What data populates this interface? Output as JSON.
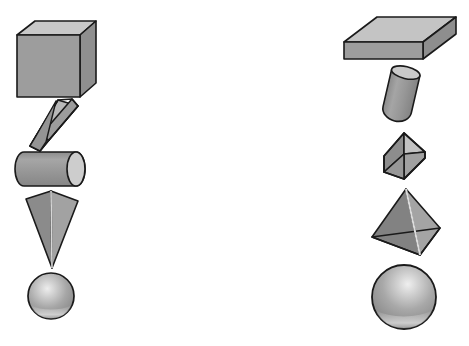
{
  "canvas": {
    "width": 469,
    "height": 346,
    "background_color": "#ffffff",
    "title": "Two columns of shaded 3D geometric solids"
  },
  "palette": {
    "outline": "#1a1a1a",
    "face_front": "#999999",
    "face_top_light": "#c6c6c6",
    "face_side_dark": "#7d7d7d",
    "face_mid": "#8e8e8e",
    "highlight": "#e6e6e6",
    "sphere_base": "#9a9a9a",
    "sphere_highlight": "#e8e8e8",
    "sphere_rim_light": "#d8d8d8"
  },
  "columns": [
    {
      "name": "left-column",
      "label": "Left column of solids",
      "items": [
        {
          "id": "cube",
          "label": "Cube",
          "shape_kind": "cube",
          "center": {
            "x": 56,
            "y": 59
          },
          "bbox": {
            "x": 17,
            "y": 20,
            "w": 80,
            "h": 78
          }
        },
        {
          "id": "tilted-bar",
          "label": "Tilted rectangular prism",
          "shape_kind": "rectangular-prism",
          "center": {
            "x": 56,
            "y": 120
          },
          "bbox": {
            "x": 32,
            "y": 99,
            "w": 48,
            "h": 42
          },
          "rotation_deg": -42
        },
        {
          "id": "horizontal-cylinder",
          "label": "Horizontal cylinder",
          "shape_kind": "cylinder",
          "center": {
            "x": 50,
            "y": 169
          },
          "bbox": {
            "x": 16,
            "y": 152,
            "w": 70,
            "h": 34
          }
        },
        {
          "id": "inverted-cone",
          "label": "Inverted narrow pyramid",
          "shape_kind": "pyramid-inverted",
          "center": {
            "x": 51,
            "y": 230
          },
          "bbox": {
            "x": 26,
            "y": 191,
            "w": 52,
            "h": 78
          }
        },
        {
          "id": "small-sphere",
          "label": "Small sphere",
          "shape_kind": "sphere",
          "center": {
            "x": 51,
            "y": 296
          },
          "radius": 23
        }
      ]
    },
    {
      "name": "right-column",
      "label": "Right column of solids",
      "items": [
        {
          "id": "flat-slab",
          "label": "Flat rectangular slab",
          "shape_kind": "box-slab",
          "center": {
            "x": 399,
            "y": 37
          },
          "bbox": {
            "x": 344,
            "y": 16,
            "w": 112,
            "h": 44
          }
        },
        {
          "id": "small-cylinder",
          "label": "Small tilted cylinder",
          "shape_kind": "cylinder-small",
          "center": {
            "x": 401,
            "y": 91
          },
          "bbox": {
            "x": 385,
            "y": 66,
            "w": 33,
            "h": 50
          },
          "rotation_deg": 12
        },
        {
          "id": "diamond",
          "label": "Diamond (tilted cube)",
          "shape_kind": "rhombohedron",
          "center": {
            "x": 404,
            "y": 156
          },
          "bbox": {
            "x": 384,
            "y": 132,
            "w": 41,
            "h": 47
          }
        },
        {
          "id": "pyramid",
          "label": "Square pyramid",
          "shape_kind": "pyramid",
          "center": {
            "x": 406,
            "y": 223
          },
          "bbox": {
            "x": 372,
            "y": 189,
            "w": 68,
            "h": 67
          }
        },
        {
          "id": "large-sphere",
          "label": "Large sphere",
          "shape_kind": "sphere",
          "center": {
            "x": 404,
            "y": 297
          },
          "radius": 32
        }
      ]
    }
  ]
}
